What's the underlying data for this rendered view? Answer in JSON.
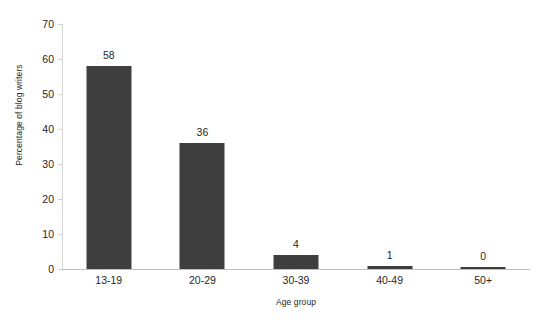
{
  "chart_data": {
    "type": "bar",
    "title": "",
    "subtitle": "",
    "xlabel": "Age group",
    "ylabel": "Percentage of blog writers",
    "categories": [
      "13-19",
      "20-29",
      "30-39",
      "40-49",
      "50+"
    ],
    "values": [
      58,
      36,
      4,
      1,
      0
    ],
    "data_labels": [
      "58",
      "36",
      "4",
      "1",
      "0"
    ],
    "ylim": [
      0,
      70
    ],
    "yticks": [
      0,
      10,
      20,
      30,
      40,
      50,
      60,
      70
    ],
    "ytick_labels": [
      "0",
      "10",
      "20",
      "30",
      "40",
      "50",
      "60",
      "70"
    ],
    "grid": false,
    "legend": false,
    "legend_position": "none",
    "series": [
      {
        "name": "Percentage of blog writers",
        "values": [
          58,
          36,
          4,
          1,
          0
        ],
        "color": "#3e3e3e"
      }
    ]
  },
  "style": {
    "bar_color": "#3e3e3e",
    "axis_color": "#bfbfbf",
    "text_color": "#262626",
    "background": "#ffffff"
  }
}
